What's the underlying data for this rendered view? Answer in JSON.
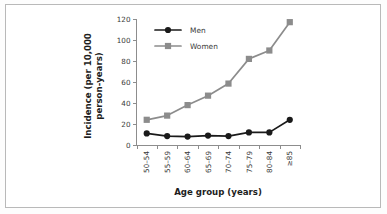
{
  "chart_data": {
    "type": "line",
    "title": "",
    "subtitle": "",
    "xlabel": "Age group (years)",
    "ylabel": "Incidence (per 10,000 person-years)",
    "ylabel_line1": "Incidence (per 10,000",
    "ylabel_line2": "person-years)",
    "categories": [
      "50–54",
      "55–59",
      "60–64",
      "65–69",
      "70–74",
      "75–79",
      "80–84",
      "≥85"
    ],
    "ylim": [
      0,
      120
    ],
    "yticks": [
      0,
      20,
      40,
      60,
      80,
      100,
      120
    ],
    "ytick_labels": [
      "0",
      "20",
      "40",
      "60",
      "80",
      "100",
      "120"
    ],
    "grid": false,
    "legend_position": "upper-left-inside",
    "series": [
      {
        "name": "Men",
        "color": "#1a1a1a",
        "marker": "circle",
        "values": [
          11,
          8.5,
          8,
          9,
          8.5,
          12,
          12,
          24
        ]
      },
      {
        "name": "Women",
        "color": "#8c8c8c",
        "marker": "square",
        "values": [
          24,
          28,
          38,
          47,
          58.5,
          82,
          90,
          117
        ]
      }
    ]
  },
  "figure": {
    "border_color": "#b9b9b9",
    "background": "#ffffff"
  }
}
